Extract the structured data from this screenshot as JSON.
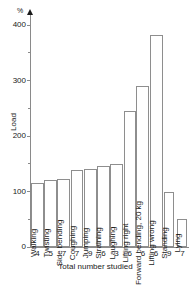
{
  "chart_data": {
    "type": "bar",
    "title": "",
    "unit_label": "%",
    "ylabel": "Load",
    "xlabel": "Total number studied",
    "ylim": [
      0,
      420
    ],
    "yticks": [
      0,
      100,
      200,
      300,
      400
    ],
    "yticks_minor": [
      50,
      150,
      250,
      350
    ],
    "grid": false,
    "legend": null,
    "categories": [
      "Walking",
      "Twisting",
      "Side bending",
      "Coughing",
      "Jumping",
      "Straining",
      "Laughing",
      "Lifting right",
      "Forward bending, 20 kg",
      "Lifting wrong",
      "Standing",
      "Lying"
    ],
    "values": [
      115,
      120,
      123,
      138,
      140,
      146,
      149,
      245,
      290,
      383,
      100,
      50
    ],
    "sample_sizes": [
      4,
      5,
      7,
      7,
      9,
      6,
      3,
      6,
      6,
      6,
      9,
      7
    ],
    "bar_fill_color": "#ffffff",
    "bar_edge_color": "#8e8e8e",
    "axis_color": "#8a8a8a",
    "text_color": "#1a1a1a"
  }
}
